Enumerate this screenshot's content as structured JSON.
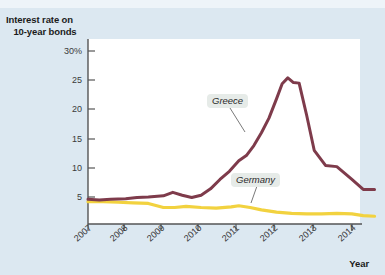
{
  "figure": {
    "background_color": "#dce8f1",
    "plot_background_color": "#ffffff"
  },
  "axes": {
    "y_title_line1": "Interest rate on",
    "y_title_line2": "10-year bonds",
    "x_title": "Year",
    "y_ticks": [
      "30%",
      "25",
      "20",
      "15",
      "10",
      "5"
    ],
    "x_ticks": [
      "2007",
      "2008",
      "2009",
      "2010",
      "2011",
      "2012",
      "2013",
      "2014"
    ]
  },
  "labels": {
    "greece": "Greece",
    "germany": "Germany"
  },
  "colors": {
    "greece": "#7e3b4b",
    "germany": "#f2d23f",
    "axis": "#555555",
    "page": "#dce8f1",
    "label_box": "#e6ebe8"
  },
  "chart_data": {
    "type": "line",
    "title": "",
    "xlabel": "Year",
    "ylabel": "Interest rate on 10-year bonds",
    "ylim": [
      0,
      30
    ],
    "xlim": [
      2007,
      2014.6
    ],
    "grid": false,
    "legend": "inline-annotations",
    "yticks": [
      5,
      10,
      15,
      20,
      25,
      30
    ],
    "xticks": [
      2007,
      2008,
      2009,
      2010,
      2011,
      2012,
      2013,
      2014
    ],
    "series": [
      {
        "name": "Greece",
        "color": "#7e3b4b",
        "x": [
          2007.0,
          2007.3,
          2007.6,
          2008.0,
          2008.3,
          2008.6,
          2009.0,
          2009.25,
          2009.5,
          2009.75,
          2010.0,
          2010.25,
          2010.5,
          2010.75,
          2011.0,
          2011.2,
          2011.4,
          2011.6,
          2011.8,
          2012.0,
          2012.15,
          2012.3,
          2012.45,
          2012.6,
          2012.8,
          2013.0,
          2013.3,
          2013.6,
          2014.0,
          2014.3,
          2014.6
        ],
        "y": [
          4.6,
          4.5,
          4.6,
          4.7,
          4.9,
          5.0,
          5.2,
          5.8,
          5.3,
          4.9,
          5.3,
          6.4,
          8.0,
          9.4,
          11.2,
          12.1,
          13.8,
          16.0,
          18.5,
          21.8,
          24.4,
          25.4,
          24.6,
          24.5,
          19.0,
          13.0,
          10.4,
          10.2,
          8.0,
          6.3,
          6.3
        ]
      },
      {
        "name": "Germany",
        "color": "#f2d23f",
        "x": [
          2007.0,
          2007.4,
          2007.8,
          2008.2,
          2008.6,
          2009.0,
          2009.3,
          2009.6,
          2010.0,
          2010.4,
          2010.8,
          2011.0,
          2011.3,
          2011.6,
          2012.0,
          2012.4,
          2012.8,
          2013.2,
          2013.6,
          2014.0,
          2014.3,
          2014.6
        ],
        "y": [
          4.2,
          4.2,
          4.1,
          4.0,
          3.9,
          3.2,
          3.2,
          3.4,
          3.2,
          3.1,
          3.3,
          3.5,
          3.2,
          2.8,
          2.4,
          2.2,
          2.1,
          2.1,
          2.2,
          2.1,
          1.8,
          1.7
        ]
      }
    ],
    "annotations": [
      {
        "text": "Greece",
        "series": "Greece",
        "x": 2010.2,
        "y": 18.5
      },
      {
        "text": "Germany",
        "series": "Germany",
        "x": 2011.0,
        "y": 7.2
      }
    ]
  }
}
